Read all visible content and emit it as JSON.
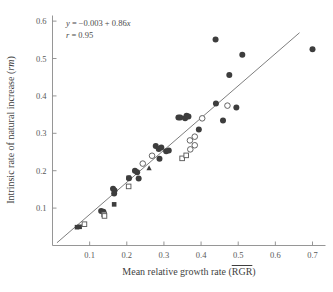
{
  "chart_data": {
    "type": "scatter",
    "title": "",
    "xlabel": "Mean relative growth rate (RGR)",
    "xlabel_base": "Mean relative growth rate (",
    "xlabel_overbar": "RGR",
    "xlabel_tail": ")",
    "ylabel": "Intrinsic rate of natural increase (rm)",
    "ylabel_base": "Intrinsic rate of natural increase (",
    "ylabel_italic": "rm",
    "ylabel_tail": ")",
    "xlim": [
      0.0,
      0.735
    ],
    "ylim": [
      0.0,
      0.615
    ],
    "xticks": [
      0.1,
      0.2,
      0.3,
      0.4,
      0.5,
      0.6,
      0.7
    ],
    "xticklabels": [
      "0.1",
      "0.2",
      "0.3",
      "0.4",
      "0.5",
      "0.6",
      "0.7"
    ],
    "yticks": [
      0.1,
      0.2,
      0.3,
      0.4,
      0.5,
      0.6
    ],
    "yticklabels": [
      "0.1",
      "0.2",
      "0.3",
      "0.4",
      "0.5",
      "0.6"
    ],
    "grid": false,
    "legend": "none",
    "annotations": [
      {
        "name": "regression-equation",
        "text": "y = −0.003 + 0.86x",
        "lead_italic": "y",
        "rest": " = −0.003 + 0.86",
        "trail_italic": "x"
      },
      {
        "name": "correlation-coefficient",
        "text": "r = 0.95",
        "lead_italic": "r",
        "rest": " = 0.95"
      }
    ],
    "fit": {
      "name": "regression-line",
      "intercept": -0.003,
      "slope": 0.86,
      "r": 0.95,
      "x_start": 0.012,
      "x_end": 0.665
    },
    "series": [
      {
        "name": "filled-circles",
        "marker": "filled-circle",
        "points": [
          [
            0.163,
            0.152
          ],
          [
            0.167,
            0.147
          ],
          [
            0.166,
            0.139
          ],
          [
            0.131,
            0.092
          ],
          [
            0.137,
            0.09
          ],
          [
            0.206,
            0.18
          ],
          [
            0.222,
            0.2
          ],
          [
            0.228,
            0.196
          ],
          [
            0.232,
            0.179
          ],
          [
            0.278,
            0.266
          ],
          [
            0.286,
            0.258
          ],
          [
            0.293,
            0.262
          ],
          [
            0.288,
            0.232
          ],
          [
            0.306,
            0.252
          ],
          [
            0.313,
            0.254
          ],
          [
            0.339,
            0.342
          ],
          [
            0.344,
            0.342
          ],
          [
            0.357,
            0.34
          ],
          [
            0.361,
            0.347
          ],
          [
            0.366,
            0.345
          ],
          [
            0.394,
            0.31
          ],
          [
            0.439,
            0.551
          ],
          [
            0.44,
            0.38
          ],
          [
            0.459,
            0.334
          ],
          [
            0.476,
            0.456
          ],
          [
            0.495,
            0.369
          ],
          [
            0.511,
            0.51
          ],
          [
            0.7,
            0.525
          ]
        ]
      },
      {
        "name": "open-circles",
        "marker": "open-circle",
        "points": [
          [
            0.37,
            0.281
          ],
          [
            0.383,
            0.291
          ],
          [
            0.383,
            0.268
          ],
          [
            0.371,
            0.257
          ],
          [
            0.403,
            0.34
          ],
          [
            0.471,
            0.374
          ],
          [
            0.243,
            0.219
          ],
          [
            0.268,
            0.24
          ]
        ]
      },
      {
        "name": "filled-squares",
        "marker": "filled-square",
        "points": [
          [
            0.066,
            0.049
          ],
          [
            0.073,
            0.05
          ],
          [
            0.166,
            0.11
          ],
          [
            0.205,
            0.181
          ]
        ]
      },
      {
        "name": "open-squares",
        "marker": "open-square",
        "points": [
          [
            0.086,
            0.057
          ],
          [
            0.139,
            0.083
          ],
          [
            0.14,
            0.079
          ],
          [
            0.205,
            0.158
          ],
          [
            0.349,
            0.233
          ],
          [
            0.36,
            0.241
          ]
        ]
      },
      {
        "name": "filled-triangles",
        "marker": "filled-triangle",
        "points": [
          [
            0.26,
            0.208
          ]
        ]
      }
    ]
  },
  "figure": {
    "background_color": "#ffffff",
    "marker_fill_color": "#3d3d3d",
    "marker_stroke_color": "#545454",
    "axis_color": "#8a8a8a",
    "line_color": "#6f6f6f",
    "text_color": "#4a4a4a"
  }
}
